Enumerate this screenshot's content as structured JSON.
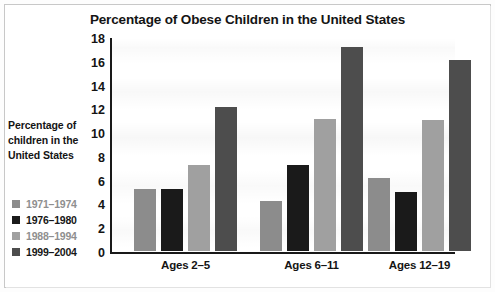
{
  "chart_data": {
    "type": "bar",
    "title": "Percentage of Obese Children in the United States",
    "xlabel": "",
    "ylabel": "Percentage of children in the United States",
    "ylabel_lines": [
      "Percentage of",
      "children in the",
      "United States"
    ],
    "categories": [
      "Ages 2–5",
      "Ages 6–11",
      "Ages 12–19"
    ],
    "series": [
      {
        "name": "1971–1974",
        "color": "#8c8c8c",
        "values": [
          5.2,
          4.2,
          6.1
        ]
      },
      {
        "name": "1976–1980",
        "color": "#1a1a1a",
        "values": [
          5.2,
          7.2,
          5.0
        ]
      },
      {
        "name": "1988–1994",
        "color": "#a0a0a0",
        "values": [
          7.2,
          11.1,
          11.0
        ]
      },
      {
        "name": "1999–2004",
        "color": "#4d4d4d",
        "values": [
          12.1,
          17.2,
          16.1
        ]
      }
    ],
    "ylim": [
      0,
      18
    ],
    "ytick_step": 2,
    "yticks": [
      18,
      16,
      14,
      12,
      10,
      8,
      6,
      4,
      2,
      0
    ],
    "grid": false,
    "legend_position": "left-bottom"
  }
}
